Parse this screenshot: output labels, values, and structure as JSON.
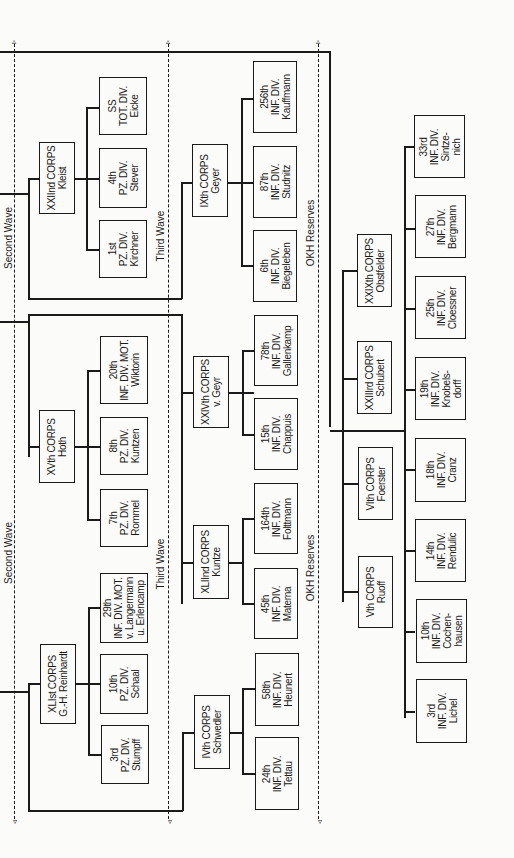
{
  "waves": {
    "second": "Second Wave",
    "third": "Third Wave",
    "okh": "OKH Reserves"
  },
  "groups": {
    "kleist": {
      "corps": "XXIInd CORPS\nKleist",
      "divisions": [
        "SS\nTOT. DIV.\nEicke",
        "4th\nPZ. DIV.\nStever",
        "1st\nPZ. DIV.\nKirchner"
      ],
      "ix": "IXth CORPS\nGeyer",
      "ix_divisions": [
        "256th\nINF. DIV.\nKauffmann",
        "87th\nINF. DIV.\nStudnitz",
        "6th\nINF. DIV.\nBiegeleben"
      ]
    },
    "hoth": {
      "corps": "XVth CORPS\nHoth",
      "divisions": [
        "20th\nINF. DIV. MOT.\nWiktorin",
        "8th\nPZ. DIV.\nKuntzen",
        "7th\nPZ. DIV.\nRommel"
      ],
      "xxiv": "XXIVth CORPS\nv. Geyr",
      "xxiv_divisions": [
        "78th\nINF. DIV.\nGallenkamp",
        "15th\nINF. DIV.\nChappuis"
      ],
      "xlii": "XLIInd CORPS\nKuntze",
      "xlii_divisions": [
        "164th\nINF. DIV.\nFolttmann",
        "45th\nINF. DIV.\nMaterna"
      ]
    },
    "reinhardt": {
      "corps": "XLIst CORPS\nG.-H. Reinhardt",
      "divisions": [
        "29th\nINF. DIV. MOT.\nv. Langermann\nu. Erlencamp",
        "10th\nPZ. DIV.\nSchaal",
        "3rd\nPZ. DIV.\nStumpff"
      ],
      "iv": "IVth CORPS\nSchwedler",
      "iv_divisions": [
        "58th\nINF. DIV.\nHeunert",
        "24th\nINF. DIV.\nTettau"
      ]
    },
    "okh": {
      "corps": [
        "XXIXth CORPS\nObstfelder",
        "XXIIIrd CORPS\nSchubert",
        "VIth CORPS\nFoerster",
        "Vth CORPS\nRuoff"
      ],
      "divisions": [
        "33rd\nINF. DIV.\nSintze-\nnich",
        "27th\nINF. DIV.\nBergmann",
        "25th\nINF. DIV.\nCloessner",
        "19th\nINF. DIV.\nKnobels-\ndorff",
        "18th\nINF. DIV.\nCranz",
        "14th\nINF. DIV.\nRendulic",
        "10th\nINF. DIV.\nCochen-\nhausen",
        "3rd\nINF. DIV.\nLichel"
      ]
    }
  }
}
